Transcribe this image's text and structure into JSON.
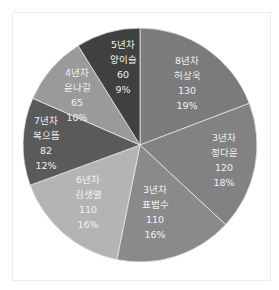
{
  "chart_data": {
    "type": "pie",
    "title": "",
    "start_angle_deg": 0,
    "direction": "clockwise",
    "total": 677,
    "slices": [
      {
        "tenure": "8년차",
        "name": "허상욱",
        "value": 130,
        "percent": "19%",
        "color": "#7b7b7b"
      },
      {
        "tenure": "3년차",
        "name": "정다운",
        "value": 120,
        "percent": "18%",
        "color": "#828282"
      },
      {
        "tenure": "3년차",
        "name": "표범수",
        "value": 110,
        "percent": "16%",
        "color": "#8a8a8a"
      },
      {
        "tenure": "6년차",
        "name": "김샛별",
        "value": 110,
        "percent": "16%",
        "color": "#b4b4b4"
      },
      {
        "tenure": "7년차",
        "name": "복으뜸",
        "value": 82,
        "percent": "12%",
        "color": "#5a5a5a"
      },
      {
        "tenure": "4년차",
        "name": "윤나길",
        "value": 65,
        "percent": "10%",
        "color": "#9a9a9a"
      },
      {
        "tenure": "5년차",
        "name": "양이슬",
        "value": 60,
        "percent": "9%",
        "color": "#404040"
      }
    ],
    "legend": "none",
    "labels": "inside (tenure, name, value, percent)"
  },
  "labels": [
    {
      "tenure": "8년차",
      "name": "허상욱",
      "value": "130",
      "percent": "19%"
    },
    {
      "tenure": "3년차",
      "name": "정다운",
      "value": "120",
      "percent": "18%"
    },
    {
      "tenure": "3년차",
      "name": "표범수",
      "value": "110",
      "percent": "16%"
    },
    {
      "tenure": "6년차",
      "name": "김샛별",
      "value": "110",
      "percent": "16%"
    },
    {
      "tenure": "7년차",
      "name": "복으뜸",
      "value": "82",
      "percent": "12%"
    },
    {
      "tenure": "4년차",
      "name": "윤나길",
      "value": "65",
      "percent": "10%"
    },
    {
      "tenure": "5년차",
      "name": "양이슬",
      "value": "60",
      "percent": "9%"
    }
  ]
}
